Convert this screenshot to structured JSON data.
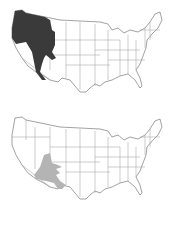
{
  "figure": {
    "panels": [
      {
        "id": "top",
        "region_label": "Northwestern range",
        "shade_color": "#3a3a3a",
        "states_shaded": [
          "Washington",
          "Oregon",
          "Idaho",
          "Nevada",
          "Utah",
          "Wyoming",
          "Montana",
          "California"
        ]
      },
      {
        "id": "bottom",
        "region_label": "Southwestern range",
        "shade_color": "#b4b4b4",
        "states_shaded": [
          "Arizona",
          "New Mexico",
          "Texas"
        ]
      }
    ],
    "outline_color": "#8a8a8a",
    "background": "#ffffff"
  }
}
